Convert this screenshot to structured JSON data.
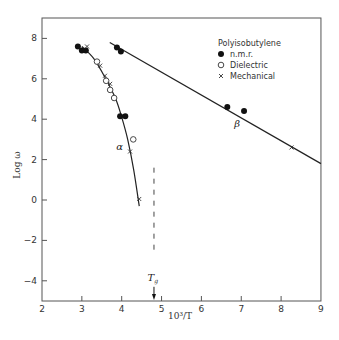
{
  "chart_data": {
    "type": "scatter",
    "title": "",
    "xlabel": "10³/T",
    "ylabel": "Log ω",
    "xlim": [
      2,
      9
    ],
    "ylim": [
      -5,
      9
    ],
    "xticks": [
      2,
      3,
      4,
      5,
      6,
      7,
      8,
      9
    ],
    "yticks": [
      -4,
      -2,
      0,
      2,
      4,
      6,
      8
    ],
    "grid": false,
    "legend": {
      "position": "upper right",
      "title": "Polyisobutylene",
      "entries": [
        {
          "marker": "filled-circle",
          "label": "n.m.r."
        },
        {
          "marker": "open-circle",
          "label": "Dielectric"
        },
        {
          "marker": "cross",
          "label": "Mechanical"
        }
      ]
    },
    "series": [
      {
        "name": "n.m.r.",
        "marker": "filled-circle",
        "points": [
          [
            2.9,
            7.6
          ],
          [
            3.0,
            7.4
          ],
          [
            3.1,
            7.4
          ],
          [
            3.96,
            4.15
          ],
          [
            4.09,
            4.15
          ],
          [
            3.88,
            7.55
          ],
          [
            3.98,
            7.35
          ],
          [
            6.65,
            4.6
          ],
          [
            7.07,
            4.4
          ]
        ]
      },
      {
        "name": "Dielectric",
        "marker": "open-circle",
        "points": [
          [
            3.38,
            6.85
          ],
          [
            3.61,
            5.9
          ],
          [
            3.71,
            5.45
          ],
          [
            3.81,
            5.05
          ],
          [
            4.29,
            3.0
          ]
        ]
      },
      {
        "name": "Mechanical",
        "marker": "cross",
        "points": [
          [
            3.13,
            7.6
          ],
          [
            3.46,
            6.65
          ],
          [
            3.58,
            6.15
          ],
          [
            3.71,
            5.75
          ],
          [
            4.21,
            2.4
          ],
          [
            4.44,
            0.05
          ],
          [
            8.26,
            2.6
          ]
        ]
      }
    ],
    "curves": [
      {
        "name": "alpha",
        "label": "α",
        "points": [
          [
            3.0,
            7.6
          ],
          [
            3.3,
            7.0
          ],
          [
            3.6,
            6.0
          ],
          [
            3.85,
            5.0
          ],
          [
            4.0,
            4.1
          ],
          [
            4.15,
            3.0
          ],
          [
            4.3,
            1.5
          ],
          [
            4.44,
            -0.3
          ]
        ]
      },
      {
        "name": "beta",
        "label": "β",
        "points": [
          [
            3.7,
            7.8
          ],
          [
            9.0,
            1.8
          ]
        ]
      }
    ],
    "annotations": [
      {
        "text": "α",
        "x": 3.95,
        "y": 2.5
      },
      {
        "text": "β",
        "x": 6.9,
        "y": 3.6
      },
      {
        "text": "Tg",
        "x": 4.78,
        "y": -4.0,
        "note": "arrow pointing to x-axis at x≈4.8"
      },
      {
        "type": "dashed-vline",
        "x": 4.81,
        "y_from": 1.6,
        "y_to": -2.7
      }
    ]
  }
}
